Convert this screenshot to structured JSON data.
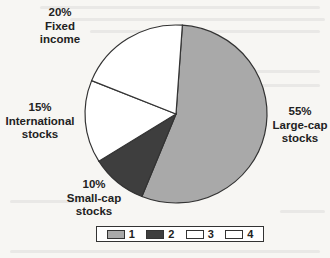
{
  "chart_data": {
    "type": "pie",
    "title": "",
    "slices": [
      {
        "id": "1",
        "label": "Large-cap stocks",
        "value": 55,
        "percent_label": "55%",
        "color": "#a9a9a9"
      },
      {
        "id": "2",
        "label": "Small-cap stocks",
        "value": 10,
        "percent_label": "10%",
        "color": "#3e3e3e"
      },
      {
        "id": "3",
        "label": "International stocks",
        "value": 15,
        "percent_label": "15%",
        "color": "#ffffff"
      },
      {
        "id": "4",
        "label": "Fixed income",
        "value": 20,
        "percent_label": "20%",
        "color": "#ffffff"
      }
    ],
    "legend": {
      "position": "bottom",
      "entries": [
        "1",
        "2",
        "3",
        "4"
      ]
    }
  },
  "labels": {
    "fixed": {
      "pct": "20%",
      "l1": "Fixed",
      "l2": "income"
    },
    "intl": {
      "pct": "15%",
      "l1": "International",
      "l2": "stocks"
    },
    "small": {
      "pct": "10%",
      "l1": "Small-cap",
      "l2": "stocks"
    },
    "large": {
      "pct": "55%",
      "l1": "Large-cap",
      "l2": "stocks"
    }
  },
  "legend": {
    "l1": "1",
    "l2": "2",
    "l3": "3",
    "l4": "4"
  }
}
